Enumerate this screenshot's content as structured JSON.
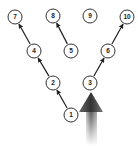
{
  "diagram": {
    "type": "tree",
    "nodes": [
      {
        "id": "1",
        "label": "1",
        "x": 71,
        "y": 115
      },
      {
        "id": "2",
        "label": "2",
        "x": 53,
        "y": 83
      },
      {
        "id": "3",
        "label": "3",
        "x": 90,
        "y": 83
      },
      {
        "id": "4",
        "label": "4",
        "x": 34,
        "y": 51
      },
      {
        "id": "5",
        "label": "5",
        "x": 71,
        "y": 51
      },
      {
        "id": "6",
        "label": "6",
        "x": 108,
        "y": 51
      },
      {
        "id": "7",
        "label": "7",
        "x": 15,
        "y": 17
      },
      {
        "id": "8",
        "label": "8",
        "x": 53,
        "y": 16
      },
      {
        "id": "9",
        "label": "9",
        "x": 90,
        "y": 16
      },
      {
        "id": "10",
        "label": "10",
        "x": 127,
        "y": 17
      }
    ],
    "edges": [
      {
        "from": "1",
        "to": "2"
      },
      {
        "from": "2",
        "to": "4"
      },
      {
        "from": "4",
        "to": "7"
      },
      {
        "from": "5",
        "to": "8"
      },
      {
        "from": "3",
        "to": "6"
      },
      {
        "from": "6",
        "to": "10"
      }
    ],
    "big_arrow": {
      "target": "3",
      "color": "#444444"
    },
    "colors": {
      "node_stroke": "#333333",
      "node_fill": "#ffffff",
      "edge": "#222222"
    }
  }
}
